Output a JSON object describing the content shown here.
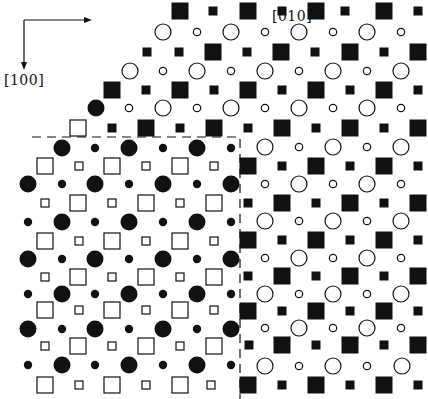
{
  "figure": {
    "axes": {
      "horizontal": {
        "label": "[010]",
        "label_x": 272,
        "label_y": 8
      },
      "vertical": {
        "label": "[100]",
        "label_x": 4,
        "label_y": 72
      },
      "origin": [
        24,
        20
      ],
      "h_end": [
        86,
        20
      ],
      "v_end": [
        24,
        64
      ]
    },
    "legend_semantics": {
      "upper_right_region": "open circles + filled squares",
      "lower_left_region": "filled circles + open squares",
      "boundary": "dashed line"
    },
    "sizes": {
      "large_circle_r": 8.5,
      "small_circle_r": 4.2,
      "large_square": 17,
      "small_square": 9
    },
    "dashed_boundary": {
      "points": [
        [
          32,
          137
        ],
        [
          240,
          137
        ],
        [
          240,
          399
        ]
      ]
    },
    "upper_region_rows": [
      {
        "y": 11,
        "kind": "square",
        "items": [
          [
            "L",
            180
          ],
          [
            "S",
            213
          ],
          [
            "L",
            248
          ],
          [
            "S",
            282
          ],
          [
            "L",
            316
          ],
          [
            "S",
            345
          ],
          [
            "L",
            384
          ],
          [
            "S",
            418
          ]
        ]
      },
      {
        "y": 32,
        "kind": "circle",
        "items": [
          [
            "L",
            163
          ],
          [
            "S",
            197
          ],
          [
            "L",
            231
          ],
          [
            "S",
            265
          ],
          [
            "L",
            299
          ],
          [
            "S",
            333
          ],
          [
            "L",
            367
          ],
          [
            "S",
            401
          ]
        ]
      },
      {
        "y": 52,
        "kind": "square",
        "items": [
          [
            "S",
            147
          ],
          [
            "S",
            179
          ],
          [
            "L",
            213
          ],
          [
            "S",
            247
          ],
          [
            "L",
            281
          ],
          [
            "S",
            315
          ],
          [
            "L",
            350
          ],
          [
            "S",
            384
          ],
          [
            "L",
            418
          ]
        ]
      },
      {
        "y": 71,
        "kind": "circle",
        "items": [
          [
            "L",
            130
          ],
          [
            "S",
            163
          ],
          [
            "L",
            197
          ],
          [
            "S",
            231
          ],
          [
            "L",
            265
          ],
          [
            "S",
            299
          ],
          [
            "L",
            333
          ],
          [
            "S",
            367
          ],
          [
            "L",
            401
          ]
        ]
      },
      {
        "y": 90,
        "kind": "square",
        "items": [
          [
            "L",
            112
          ],
          [
            "S",
            146
          ],
          [
            "L",
            180
          ],
          [
            "S",
            214
          ],
          [
            "L",
            248
          ],
          [
            "S",
            282
          ],
          [
            "L",
            316
          ],
          [
            "S",
            350
          ],
          [
            "L",
            384
          ],
          [
            "S",
            418
          ]
        ]
      },
      {
        "y": 108,
        "kind": "circle",
        "items": [
          [
            "S",
            129
          ],
          [
            "L",
            163
          ],
          [
            "S",
            197
          ],
          [
            "L",
            231
          ],
          [
            "S",
            265
          ],
          [
            "L",
            299
          ],
          [
            "S",
            333
          ],
          [
            "L",
            367
          ],
          [
            "S",
            401
          ]
        ]
      },
      {
        "y": 128,
        "kind": "square",
        "items": [
          [
            "S",
            112
          ],
          [
            "L",
            146
          ],
          [
            "S",
            180
          ],
          [
            "L",
            214
          ],
          [
            "S",
            248
          ],
          [
            "L",
            282
          ],
          [
            "S",
            316
          ],
          [
            "L",
            350
          ],
          [
            "S",
            384
          ],
          [
            "L",
            418
          ]
        ]
      }
    ],
    "upper_boundary_extras": [
      {
        "x": 96,
        "y": 108,
        "shape": "circle",
        "size": "L",
        "fill": "filled"
      },
      {
        "x": 78,
        "y": 128,
        "shape": "square",
        "size": "L",
        "fill": "open"
      }
    ],
    "right_region_rows": [
      {
        "y": 147,
        "kind": "circle",
        "items": [
          [
            "L",
            265
          ],
          [
            "S",
            299
          ],
          [
            "L",
            333
          ],
          [
            "S",
            367
          ],
          [
            "L",
            401
          ]
        ]
      },
      {
        "y": 166,
        "kind": "square",
        "items": [
          [
            "L",
            248
          ],
          [
            "S",
            282
          ],
          [
            "L",
            316
          ],
          [
            "S",
            350
          ],
          [
            "L",
            384
          ],
          [
            "S",
            418
          ]
        ]
      },
      {
        "y": 184,
        "kind": "circle",
        "items": [
          [
            "S",
            265
          ],
          [
            "L",
            299
          ],
          [
            "S",
            333
          ],
          [
            "L",
            367
          ],
          [
            "S",
            401
          ]
        ]
      },
      {
        "y": 203,
        "kind": "square",
        "items": [
          [
            "S",
            248
          ],
          [
            "L",
            282
          ],
          [
            "S",
            316
          ],
          [
            "L",
            350
          ],
          [
            "S",
            384
          ],
          [
            "L",
            418
          ]
        ]
      },
      {
        "y": 221,
        "kind": "circle",
        "items": [
          [
            "L",
            265
          ],
          [
            "S",
            299
          ],
          [
            "L",
            333
          ],
          [
            "S",
            367
          ],
          [
            "L",
            401
          ]
        ]
      },
      {
        "y": 240,
        "kind": "square",
        "items": [
          [
            "L",
            248
          ],
          [
            "S",
            282
          ],
          [
            "L",
            316
          ],
          [
            "S",
            350
          ],
          [
            "L",
            384
          ],
          [
            "S",
            418
          ]
        ]
      },
      {
        "y": 258,
        "kind": "circle",
        "items": [
          [
            "S",
            265
          ],
          [
            "L",
            299
          ],
          [
            "S",
            333
          ],
          [
            "L",
            367
          ],
          [
            "S",
            401
          ]
        ]
      },
      {
        "y": 276,
        "kind": "square",
        "items": [
          [
            "S",
            248
          ],
          [
            "L",
            282
          ],
          [
            "S",
            316
          ],
          [
            "L",
            350
          ],
          [
            "S",
            384
          ],
          [
            "L",
            418
          ]
        ]
      },
      {
        "y": 294,
        "kind": "circle",
        "items": [
          [
            "L",
            265
          ],
          [
            "S",
            299
          ],
          [
            "L",
            333
          ],
          [
            "S",
            367
          ],
          [
            "L",
            401
          ]
        ]
      },
      {
        "y": 311,
        "kind": "square",
        "items": [
          [
            "L",
            248
          ],
          [
            "S",
            282
          ],
          [
            "L",
            316
          ],
          [
            "S",
            350
          ],
          [
            "L",
            384
          ],
          [
            "S",
            418
          ]
        ]
      },
      {
        "y": 328,
        "kind": "circle",
        "items": [
          [
            "S",
            265
          ],
          [
            "L",
            299
          ],
          [
            "S",
            333
          ],
          [
            "L",
            367
          ],
          [
            "S",
            401
          ]
        ]
      },
      {
        "y": 345,
        "kind": "square",
        "items": [
          [
            "S",
            249
          ],
          [
            "L",
            282
          ],
          [
            "S",
            316
          ],
          [
            "L",
            350
          ],
          [
            "S",
            384
          ],
          [
            "L",
            418
          ]
        ]
      },
      {
        "y": 366,
        "kind": "circle",
        "items": [
          [
            "L",
            265
          ],
          [
            "S",
            299
          ],
          [
            "L",
            333
          ],
          [
            "S",
            367
          ],
          [
            "L",
            402
          ]
        ]
      },
      {
        "y": 385,
        "kind": "square",
        "items": [
          [
            "L",
            248
          ],
          [
            "S",
            282
          ],
          [
            "L",
            316
          ],
          [
            "S",
            350
          ],
          [
            "L",
            384
          ],
          [
            "S",
            418
          ]
        ]
      }
    ],
    "lower_left_rows": [
      {
        "y": 148,
        "kind": "circle",
        "items": [
          [
            "L",
            62
          ],
          [
            "S",
            95
          ],
          [
            "L",
            129
          ],
          [
            "S",
            163
          ],
          [
            "L",
            197
          ],
          [
            "S",
            231
          ]
        ]
      },
      {
        "y": 166,
        "kind": "square",
        "items": [
          [
            "L",
            45
          ],
          [
            "S",
            79
          ],
          [
            "L",
            112
          ],
          [
            "S",
            146
          ],
          [
            "L",
            180
          ],
          [
            "S",
            214
          ]
        ]
      },
      {
        "y": 184,
        "kind": "circle",
        "items": [
          [
            "L",
            28
          ],
          [
            "S",
            62
          ],
          [
            "L",
            95
          ],
          [
            "S",
            129
          ],
          [
            "L",
            163
          ],
          [
            "S",
            197
          ],
          [
            "L",
            231
          ]
        ]
      },
      {
        "y": 203,
        "kind": "square",
        "items": [
          [
            "S",
            45
          ],
          [
            "L",
            78
          ],
          [
            "S",
            112
          ],
          [
            "L",
            146
          ],
          [
            "S",
            180
          ],
          [
            "L",
            214
          ]
        ]
      },
      {
        "y": 222,
        "kind": "circle",
        "items": [
          [
            "S",
            28
          ],
          [
            "L",
            62
          ],
          [
            "S",
            95
          ],
          [
            "L",
            129
          ],
          [
            "S",
            163
          ],
          [
            "L",
            197
          ],
          [
            "S",
            231
          ]
        ]
      },
      {
        "y": 241,
        "kind": "square",
        "items": [
          [
            "L",
            45
          ],
          [
            "S",
            79
          ],
          [
            "L",
            112
          ],
          [
            "S",
            146
          ],
          [
            "L",
            180
          ],
          [
            "S",
            214
          ]
        ]
      },
      {
        "y": 259,
        "kind": "circle",
        "items": [
          [
            "L",
            28
          ],
          [
            "S",
            62
          ],
          [
            "L",
            95
          ],
          [
            "S",
            129
          ],
          [
            "L",
            163
          ],
          [
            "S",
            197
          ],
          [
            "L",
            231
          ]
        ]
      },
      {
        "y": 277,
        "kind": "square",
        "items": [
          [
            "S",
            45
          ],
          [
            "L",
            78
          ],
          [
            "S",
            112
          ],
          [
            "L",
            146
          ],
          [
            "S",
            180
          ],
          [
            "L",
            214
          ]
        ]
      },
      {
        "y": 294,
        "kind": "circle",
        "items": [
          [
            "S",
            28
          ],
          [
            "L",
            62
          ],
          [
            "S",
            95
          ],
          [
            "L",
            129
          ],
          [
            "S",
            163
          ],
          [
            "L",
            197
          ],
          [
            "S",
            231
          ]
        ]
      },
      {
        "y": 310,
        "kind": "square",
        "items": [
          [
            "L",
            45
          ],
          [
            "S",
            79
          ],
          [
            "L",
            112
          ],
          [
            "S",
            146
          ],
          [
            "L",
            180
          ],
          [
            "S",
            214
          ]
        ]
      },
      {
        "y": 329,
        "kind": "circle",
        "items": [
          [
            "L",
            28
          ],
          [
            "S",
            62
          ],
          [
            "L",
            95
          ],
          [
            "S",
            129
          ],
          [
            "L",
            163
          ],
          [
            "S",
            197
          ],
          [
            "L",
            231
          ]
        ]
      },
      {
        "y": 346,
        "kind": "square",
        "items": [
          [
            "S",
            45
          ],
          [
            "L",
            78
          ],
          [
            "S",
            112
          ],
          [
            "L",
            146
          ],
          [
            "S",
            180
          ],
          [
            "L",
            214
          ]
        ]
      },
      {
        "y": 365,
        "kind": "circle",
        "items": [
          [
            "S",
            28
          ],
          [
            "L",
            62
          ],
          [
            "S",
            95
          ],
          [
            "L",
            129
          ],
          [
            "S",
            163
          ],
          [
            "L",
            197
          ],
          [
            "S",
            231
          ]
        ]
      },
      {
        "y": 385,
        "kind": "square",
        "items": [
          [
            "L",
            45
          ],
          [
            "S",
            79
          ],
          [
            "L",
            112
          ],
          [
            "S",
            146
          ],
          [
            "L",
            180
          ],
          [
            "S",
            211
          ]
        ]
      }
    ],
    "colors": {
      "ink": "#111111",
      "background": "#ffffff"
    }
  }
}
